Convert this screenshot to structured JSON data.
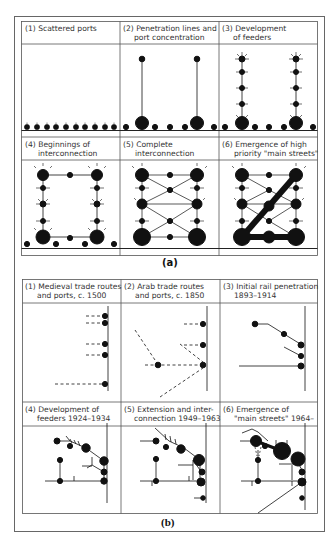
{
  "figure": {
    "part_a": {
      "caption": "(a)",
      "panels": [
        {
          "title_line1": "(1) Scattered ports",
          "title_line2": ""
        },
        {
          "title_line1": "(2) Penetration lines and",
          "title_line2": "port concentration"
        },
        {
          "title_line1": "(3) Development",
          "title_line2": "of feeders"
        },
        {
          "title_line1": "(4) Beginnings of",
          "title_line2": "interconnection"
        },
        {
          "title_line1": "(5) Complete",
          "title_line2": "interconnection"
        },
        {
          "title_line1": "(6) Emergence of high",
          "title_line2": "priority \"main streets\""
        }
      ]
    },
    "part_b": {
      "caption": "(b)",
      "panels": [
        {
          "title_line1": "(1) Medieval trade routes",
          "title_line2": "and ports, c. 1500"
        },
        {
          "title_line1": "(2) Arab trade routes",
          "title_line2": "and ports, c. 1850"
        },
        {
          "title_line1": "(3) Initial rail penetration",
          "title_line2": "1893–1914"
        },
        {
          "title_line1": "(4) Development of",
          "title_line2": "feeders 1924–1934"
        },
        {
          "title_line1": "(5) Extension and inter-",
          "title_line2": "connection 1949–1963"
        },
        {
          "title_line1": "(6) Emergence of",
          "title_line2": "\"main streets\" 1964–"
        }
      ]
    },
    "colors": {
      "ink": "#111111",
      "frame": "#555555",
      "text": "#333333"
    }
  }
}
